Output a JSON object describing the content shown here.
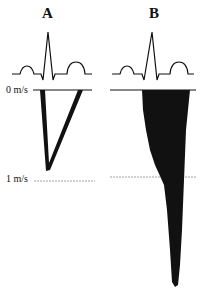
{
  "panels": [
    {
      "label": "A"
    },
    {
      "label": "B"
    }
  ],
  "axis": {
    "zero_label": "0 m/s",
    "one_label": "1 m/s"
  },
  "colors": {
    "ink": "#111111",
    "dashed": "#888888"
  }
}
